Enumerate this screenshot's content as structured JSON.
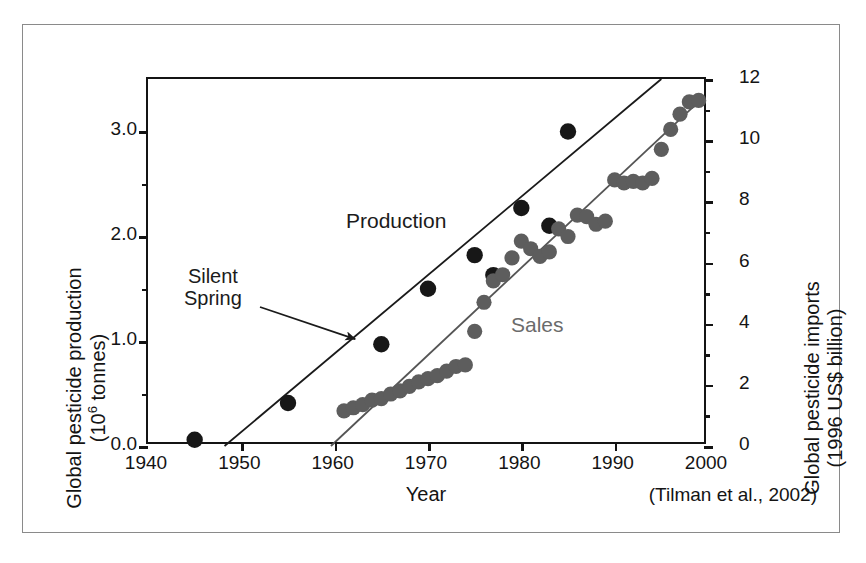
{
  "figure": {
    "citation": "(Tilman et al., 2002)"
  },
  "axes": {
    "x": {
      "title": "Year",
      "ticks": [
        1940,
        1950,
        1960,
        1970,
        1980,
        1990,
        2000
      ],
      "tick_labels": [
        "1940",
        "1950",
        "1960",
        "1970",
        "1980",
        "1990",
        "2000"
      ],
      "range": [
        1940,
        2000
      ]
    },
    "y_left": {
      "title_line1": "Global pesticide production",
      "title_line2": "(10⁶ tonnes)",
      "ticks": [
        0.0,
        1.0,
        2.0,
        3.0
      ],
      "tick_labels": [
        "0.0",
        "1.0",
        "2.0",
        "3.0"
      ],
      "minor_ticks": [
        0.5,
        1.5,
        2.5
      ],
      "range": [
        0.0,
        3.5
      ]
    },
    "y_right": {
      "title_line1": "Global pesticide imports",
      "title_line2": "(1996 US$ billion)",
      "ticks": [
        0,
        2,
        4,
        6,
        8,
        10,
        12
      ],
      "tick_labels": [
        "0",
        "2",
        "4",
        "6",
        "8",
        "10",
        "12"
      ],
      "minor_ticks": [
        1,
        3,
        5,
        7,
        9,
        11
      ],
      "range": [
        0,
        12
      ]
    }
  },
  "annotations": {
    "production": "Production",
    "sales": "Sales",
    "silent_spring_line1": "Silent",
    "silent_spring_line2": "Spring",
    "silent_spring_arrow_target_year": 1962
  },
  "colors": {
    "production_marker": "#171717",
    "sales_marker": "#5d5d5d",
    "production_line": "#1a1a1a",
    "sales_line": "#555555",
    "axis": "#141414",
    "frame": "#8a8a8a",
    "sales_label": "#6b6b6b"
  },
  "chart_data": {
    "type": "scatter",
    "title": "",
    "xlabel": "Year",
    "ylabel": "Global pesticide production (10⁶ tonnes)",
    "ylabel_right": "Global pesticide imports (1996 US$ billion)",
    "xlim": [
      1940,
      2000
    ],
    "ylim": [
      0.0,
      3.5
    ],
    "ylim_right": [
      0,
      12
    ],
    "grid": false,
    "legend": "inline annotations",
    "series": [
      {
        "name": "Production",
        "axis": "left",
        "units": "10^6 tonnes",
        "marker": "filled circle, black",
        "points": [
          {
            "x": 1945,
            "y": 0.06
          },
          {
            "x": 1955,
            "y": 0.41
          },
          {
            "x": 1965,
            "y": 0.97
          },
          {
            "x": 1970,
            "y": 1.5
          },
          {
            "x": 1975,
            "y": 1.82
          },
          {
            "x": 1977,
            "y": 1.63
          },
          {
            "x": 1980,
            "y": 2.27
          },
          {
            "x": 1983,
            "y": 2.1
          },
          {
            "x": 1985,
            "y": 3.0
          }
        ]
      },
      {
        "name": "Sales",
        "axis": "right",
        "units": "1996 US$ billion",
        "marker": "filled circle, gray",
        "points": [
          {
            "x": 1961,
            "y": 1.15
          },
          {
            "x": 1962,
            "y": 1.25
          },
          {
            "x": 1963,
            "y": 1.35
          },
          {
            "x": 1964,
            "y": 1.5
          },
          {
            "x": 1965,
            "y": 1.55
          },
          {
            "x": 1966,
            "y": 1.7
          },
          {
            "x": 1967,
            "y": 1.8
          },
          {
            "x": 1968,
            "y": 1.95
          },
          {
            "x": 1969,
            "y": 2.1
          },
          {
            "x": 1970,
            "y": 2.2
          },
          {
            "x": 1971,
            "y": 2.3
          },
          {
            "x": 1972,
            "y": 2.45
          },
          {
            "x": 1973,
            "y": 2.6
          },
          {
            "x": 1974,
            "y": 2.65
          },
          {
            "x": 1975,
            "y": 3.75
          },
          {
            "x": 1976,
            "y": 4.7
          },
          {
            "x": 1977,
            "y": 5.4
          },
          {
            "x": 1978,
            "y": 5.6
          },
          {
            "x": 1979,
            "y": 6.15
          },
          {
            "x": 1980,
            "y": 6.7
          },
          {
            "x": 1981,
            "y": 6.45
          },
          {
            "x": 1982,
            "y": 6.2
          },
          {
            "x": 1983,
            "y": 6.35
          },
          {
            "x": 1984,
            "y": 7.1
          },
          {
            "x": 1985,
            "y": 6.85
          },
          {
            "x": 1986,
            "y": 7.55
          },
          {
            "x": 1987,
            "y": 7.5
          },
          {
            "x": 1988,
            "y": 7.25
          },
          {
            "x": 1989,
            "y": 7.35
          },
          {
            "x": 1990,
            "y": 8.7
          },
          {
            "x": 1991,
            "y": 8.6
          },
          {
            "x": 1992,
            "y": 8.65
          },
          {
            "x": 1993,
            "y": 8.6
          },
          {
            "x": 1994,
            "y": 8.75
          },
          {
            "x": 1995,
            "y": 9.7
          },
          {
            "x": 1996,
            "y": 10.35
          },
          {
            "x": 1997,
            "y": 10.85
          },
          {
            "x": 1998,
            "y": 11.25
          },
          {
            "x": 1999,
            "y": 11.3
          }
        ]
      }
    ],
    "trend_lines": [
      {
        "name": "Production trend",
        "x_start": 1948.2,
        "y_start": 0.0,
        "x_end": 1995.0,
        "y_end": 3.5,
        "axis": "left"
      },
      {
        "name": "Sales trend",
        "x_start": 1959.6,
        "y_start": 0.0,
        "x_end": 1999.5,
        "y_end": 11.4,
        "axis": "right"
      }
    ]
  }
}
